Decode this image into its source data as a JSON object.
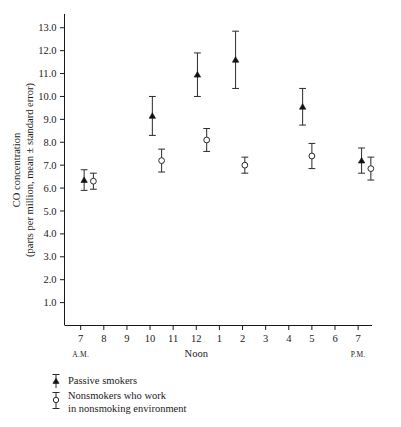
{
  "chart_data": {
    "type": "scatter",
    "title": "",
    "xlabel": "",
    "ylabel": "CO concentration (parts per million, mean ± standard error)",
    "ylabel_line1": "CO concentration",
    "ylabel_line2": "(parts per million, mean ± standard error)",
    "ylim": [
      0.0,
      13.6
    ],
    "ytick_labels": [
      "1.0",
      "2.0",
      "3.0",
      "4.0",
      "5.0",
      "6.0",
      "7.0",
      "8.0",
      "9.0",
      "10.0",
      "11.0",
      "12.0",
      "13.0"
    ],
    "ytick_values": [
      1.0,
      2.0,
      3.0,
      4.0,
      5.0,
      6.0,
      7.0,
      8.0,
      9.0,
      10.0,
      11.0,
      12.0,
      13.0
    ],
    "xtick_labels": [
      "7",
      "8",
      "9",
      "10",
      "11",
      "12",
      "1",
      "2",
      "3",
      "4",
      "5",
      "6",
      "7"
    ],
    "xtick_values": [
      7,
      8,
      9,
      10,
      11,
      12,
      13,
      14,
      15,
      16,
      17,
      18,
      19
    ],
    "xlim": [
      6.3,
      19.6
    ],
    "grid": false,
    "period_start_label": "A.M.",
    "period_noon_label": "Noon",
    "period_end_label": "P.M.",
    "period_start_at": 7,
    "period_noon_at": 12,
    "period_end_at": 19,
    "legend_position": "below-axes",
    "series": [
      {
        "name": "Passive smokers",
        "marker": "filled-triangle",
        "x": [
          7.15,
          10.1,
          12.05,
          13.7,
          16.6,
          19.15
        ],
        "values": [
          6.35,
          9.15,
          10.95,
          11.6,
          9.55,
          7.2
        ],
        "errors": [
          0.45,
          0.85,
          0.95,
          1.25,
          0.8,
          0.55
        ]
      },
      {
        "name": "Nonsmokers who work in nonsmoking environment",
        "name_line1": "Nonsmokers who work",
        "name_line2": "in nonsmoking environment",
        "marker": "open-circle",
        "x": [
          7.55,
          10.5,
          12.45,
          14.1,
          17.0,
          19.55
        ],
        "values": [
          6.3,
          7.2,
          8.1,
          7.0,
          7.4,
          6.85
        ],
        "errors": [
          0.35,
          0.5,
          0.5,
          0.35,
          0.55,
          0.5
        ]
      }
    ]
  },
  "legend": {
    "items": [
      {
        "label": "Passive smokers",
        "marker": "filled-triangle"
      },
      {
        "label_line1": "Nonsmokers who work",
        "label_line2": "in nonsmoking environment",
        "marker": "open-circle"
      }
    ]
  }
}
